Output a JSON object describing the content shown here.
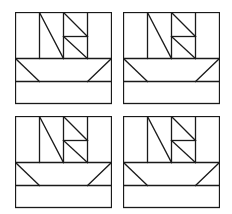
{
  "diagram": {
    "line_color": "#1a1a1a",
    "background": "#ffffff",
    "blocks": [
      {
        "id": "top-left",
        "x": 15,
        "y": 12
      },
      {
        "id": "top-right",
        "x": 123,
        "y": 12
      },
      {
        "id": "bottom-left",
        "x": 15,
        "y": 116
      },
      {
        "id": "bottom-right",
        "x": 123,
        "y": 116
      }
    ],
    "block_size": {
      "w": 96,
      "h": 91
    }
  }
}
